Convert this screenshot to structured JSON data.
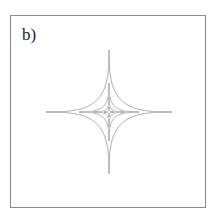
{
  "figure": {
    "panel_label": "b)",
    "center": [
      109,
      112
    ],
    "curves": [
      {
        "name": "outer",
        "radius_x": 63,
        "radius_y": 62
      },
      {
        "name": "second",
        "radius_x": 30,
        "radius_y": 29
      },
      {
        "name": "third",
        "radius_x": 15,
        "radius_y": 15
      },
      {
        "name": "innermost",
        "radius_x": 5,
        "radius_y": 5
      }
    ],
    "colors": {
      "frame": "#8a8a8a",
      "curve": "#9a9a9a",
      "label": "#222222"
    }
  }
}
